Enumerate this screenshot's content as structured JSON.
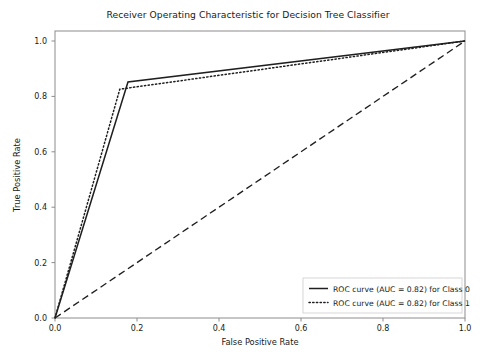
{
  "chart_data": {
    "type": "line",
    "title": "Receiver Operating Characteristic for Decision Tree Classifier",
    "xlabel": "False Positive Rate",
    "ylabel": "True Positive Rate",
    "xlim": [
      0.0,
      1.0
    ],
    "ylim": [
      0.0,
      1.0
    ],
    "xticks": [
      "0.0",
      "0.2",
      "0.4",
      "0.6",
      "0.8",
      "1.0"
    ],
    "xtick_values": [
      0.0,
      0.2,
      0.4,
      0.6,
      0.8,
      1.0
    ],
    "yticks": [
      "0.0",
      "0.2",
      "0.4",
      "0.6",
      "0.8",
      "1.0"
    ],
    "ytick_values": [
      0.0,
      0.2,
      0.4,
      0.6,
      0.8,
      1.0
    ],
    "grid": false,
    "legend_position": "lower right",
    "series": [
      {
        "name": "ROC curve (AUC = 0.82) for Class 0",
        "style": "solid",
        "color": "#1f1f1f",
        "auc": 0.82,
        "x": [
          0.0,
          0.178,
          1.0
        ],
        "y": [
          0.0,
          0.852,
          1.0
        ]
      },
      {
        "name": "ROC curve (AUC = 0.82) for Class 1",
        "style": "dotted",
        "color": "#1f1f1f",
        "auc": 0.82,
        "x": [
          0.0,
          0.158,
          1.0
        ],
        "y": [
          0.0,
          0.826,
          1.0
        ]
      },
      {
        "name": "chance-diagonal",
        "style": "dashed",
        "color": "#1f1f1f",
        "x": [
          0.0,
          1.0
        ],
        "y": [
          0.0,
          1.0
        ]
      }
    ]
  },
  "legend": {
    "entries": [
      {
        "label": "ROC curve (AUC = 0.82) for Class 0",
        "style": "solid"
      },
      {
        "label": "ROC curve (AUC = 0.82) for Class 1",
        "style": "dotted"
      }
    ]
  },
  "colors": {
    "line": "#1f1f1f",
    "axis": "#8c8c8c",
    "text": "#1a1a1a",
    "background": "#ffffff"
  }
}
